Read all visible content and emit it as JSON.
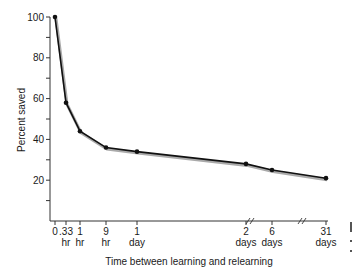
{
  "chart_data": {
    "type": "line",
    "title": "",
    "xlabel": "Time between learning and relearning",
    "ylabel": "Percent saved",
    "ylim": [
      0,
      100
    ],
    "yticks": [
      20,
      40,
      60,
      80,
      100
    ],
    "grid": false,
    "legend": null,
    "categories": [
      "0",
      ".33 hr",
      "1 hr",
      "9 hr",
      "1 day",
      "2 days",
      "6 days",
      "31 days"
    ],
    "x_tick_labels": [
      {
        "top": "0",
        "bottom": ""
      },
      {
        "top": ".33",
        "bottom": "hr"
      },
      {
        "top": "1",
        "bottom": "hr"
      },
      {
        "top": "9",
        "bottom": "hr"
      },
      {
        "top": "1",
        "bottom": "day"
      },
      {
        "top": "2",
        "bottom": "days"
      },
      {
        "top": "6",
        "bottom": "days"
      },
      {
        "top": "31",
        "bottom": "days"
      }
    ],
    "series": [
      {
        "name": "Savings",
        "values": [
          100,
          58,
          44,
          36,
          34,
          28,
          25,
          21
        ]
      }
    ],
    "axis_breaks": [
      "between 2 days and 6 days",
      "between 6 days and 31 days"
    ]
  },
  "labels": {
    "y100": "100",
    "y80": "80",
    "y60": "60",
    "y40": "40",
    "y20": "20"
  }
}
